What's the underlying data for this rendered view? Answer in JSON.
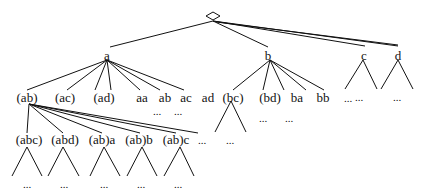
{
  "diagram": {
    "type": "tree",
    "root": {
      "symbol": "◇"
    },
    "level1": [
      {
        "id": "a",
        "label": "a"
      },
      {
        "id": "b",
        "label": "b"
      },
      {
        "id": "c",
        "label": "c",
        "subtree": "..."
      },
      {
        "id": "d",
        "label": "d",
        "subtree": "..."
      }
    ],
    "a_children": [
      "(ab)",
      "(ac)",
      "(ad)",
      "aa",
      "ab",
      "ac",
      "ad"
    ],
    "a_children_more": [
      "...",
      "..."
    ],
    "b_children": [
      "(bc)",
      "(bd)",
      "ba",
      "bb",
      "..."
    ],
    "b_children_more": [
      "...",
      "..."
    ],
    "bc_subtree": "...",
    "ab_children": [
      "(abc)",
      "(abd)",
      "(ab)a",
      "(ab)b",
      "(ab)c",
      "..."
    ],
    "ab_grandchildren": [
      "...",
      "...",
      "...",
      "...",
      "..."
    ],
    "ellipsis": "..."
  }
}
